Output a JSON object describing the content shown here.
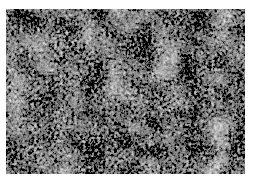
{
  "image": {
    "kind": "grayscale micrograph texture",
    "description": "Speckled grayscale surface texture with mottled dark and light granular regions",
    "background_color": "#ffffff",
    "tone_dark": "#2a2a2a",
    "tone_light": "#f2f2f2"
  }
}
